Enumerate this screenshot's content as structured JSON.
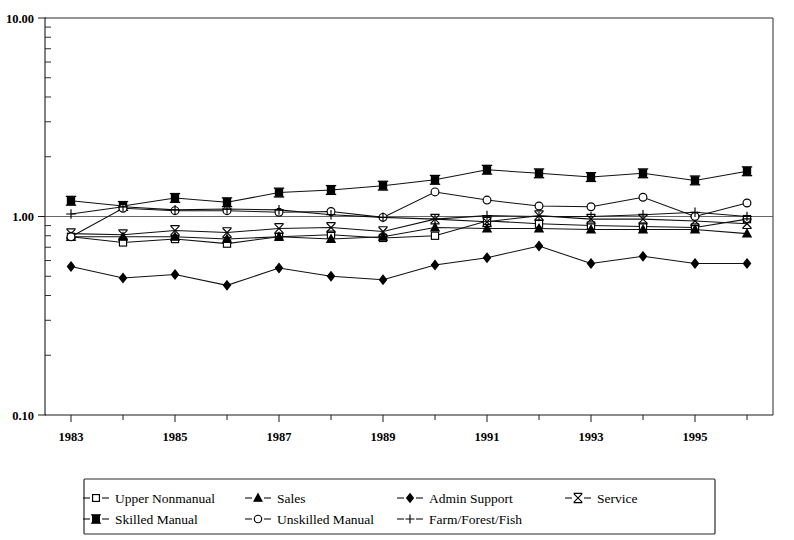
{
  "chart_data": {
    "type": "line",
    "title": "",
    "subtitle": "",
    "xlabel": "",
    "ylabel": "",
    "yscale": "log",
    "ylim": [
      0.1,
      10.0
    ],
    "y_tick_labels": [
      "10.00",
      "1.00",
      "0.10"
    ],
    "y_tick_values": [
      10.0,
      1.0,
      0.1
    ],
    "grid": false,
    "reference_line": 1.0,
    "legend_position": "bottom",
    "x": [
      1983,
      1984,
      1985,
      1986,
      1987,
      1988,
      1989,
      1990,
      1991,
      1992,
      1993,
      1994,
      1995,
      1996
    ],
    "x_tick_labels": [
      "1983",
      "1985",
      "1987",
      "1989",
      "1991",
      "1993",
      "1995"
    ],
    "x_tick_values": [
      1983,
      1985,
      1987,
      1989,
      1991,
      1993,
      1995
    ],
    "xlim": [
      1982.5,
      1996.5
    ],
    "series": [
      {
        "name": "Upper Nonmanual",
        "marker": "open-square",
        "values": [
          0.79,
          0.74,
          0.77,
          0.73,
          0.79,
          0.81,
          0.78,
          0.8,
          0.95,
          0.92,
          0.9,
          0.89,
          0.88,
          0.97
        ]
      },
      {
        "name": "Sales",
        "marker": "filled-triangle",
        "values": [
          0.79,
          0.79,
          0.79,
          0.77,
          0.79,
          0.77,
          0.79,
          0.88,
          0.87,
          0.87,
          0.86,
          0.86,
          0.86,
          0.82
        ]
      },
      {
        "name": "Admin Support",
        "marker": "filled-diamond",
        "values": [
          0.56,
          0.49,
          0.51,
          0.45,
          0.55,
          0.5,
          0.48,
          0.57,
          0.62,
          0.71,
          0.58,
          0.63,
          0.58,
          0.58
        ]
      },
      {
        "name": "Service",
        "marker": "x-star",
        "values": [
          0.82,
          0.81,
          0.85,
          0.83,
          0.87,
          0.88,
          0.84,
          0.97,
          0.94,
          1.01,
          0.97,
          0.97,
          0.95,
          0.92
        ]
      },
      {
        "name": "Skilled Manual",
        "marker": "filled-square",
        "values": [
          1.2,
          1.13,
          1.24,
          1.18,
          1.32,
          1.36,
          1.43,
          1.53,
          1.72,
          1.65,
          1.58,
          1.65,
          1.52,
          1.69
        ]
      },
      {
        "name": "Unskilled Manual",
        "marker": "open-circle",
        "values": [
          0.79,
          1.1,
          1.07,
          1.07,
          1.05,
          1.06,
          0.99,
          1.33,
          1.21,
          1.13,
          1.12,
          1.25,
          1.0,
          1.17
        ]
      },
      {
        "name": "Farm/Forest/Fish",
        "marker": "plus",
        "values": [
          1.03,
          1.12,
          1.08,
          1.09,
          1.08,
          1.02,
          0.99,
          0.97,
          1.01,
          1.0,
          1.0,
          1.02,
          1.05,
          1.0
        ]
      }
    ]
  },
  "legend": {
    "items": [
      {
        "label": "Upper Nonmanual",
        "marker": "open-square"
      },
      {
        "label": "Sales",
        "marker": "filled-triangle"
      },
      {
        "label": "Admin Support",
        "marker": "filled-diamond"
      },
      {
        "label": "Service",
        "marker": "x-star"
      },
      {
        "label": "Skilled Manual",
        "marker": "filled-square"
      },
      {
        "label": "Unskilled Manual",
        "marker": "open-circle"
      },
      {
        "label": "Farm/Forest/Fish",
        "marker": "plus"
      }
    ]
  },
  "axes": {
    "y_top_label": "10.00",
    "y_mid_label": "1.00",
    "y_bottom_label": "0.10",
    "x_labels": [
      "1983",
      "1985",
      "1987",
      "1989",
      "1991",
      "1993",
      "1995"
    ]
  },
  "colors": {
    "ink": "#000000",
    "line": "#111111",
    "axis": "#1a1a1a",
    "background": "#ffffff"
  }
}
